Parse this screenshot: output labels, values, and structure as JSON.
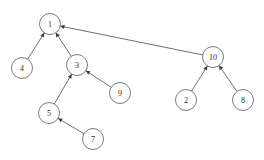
{
  "diagram": {
    "type": "directed-graph",
    "canvas": {
      "width": 264,
      "height": 160,
      "background": "#ffffff"
    },
    "style": {
      "node_radius": 10.5,
      "node_fill": "#ffffff",
      "node_stroke": "#5a5a5a",
      "edge_stroke": "#4a4a4a",
      "label_color": "#2b2b2b",
      "arrow_fill": "#3a3a3a"
    },
    "nodes": [
      {
        "id": "n1",
        "label": "1",
        "x": 50,
        "y": 24
      },
      {
        "id": "n4",
        "label": "4",
        "x": 22,
        "y": 68
      },
      {
        "id": "n3",
        "label": "3",
        "x": 77,
        "y": 65
      },
      {
        "id": "n9",
        "label": "9",
        "x": 120,
        "y": 93
      },
      {
        "id": "n5",
        "label": "5",
        "x": 49,
        "y": 113
      },
      {
        "id": "n7",
        "label": "7",
        "x": 93,
        "y": 139
      },
      {
        "id": "n10",
        "label": "10",
        "x": 213,
        "y": 57
      },
      {
        "id": "n2",
        "label": "2",
        "x": 186,
        "y": 100
      },
      {
        "id": "n8",
        "label": "8",
        "x": 243,
        "y": 100
      }
    ],
    "edges": [
      {
        "from": "n4",
        "to": "n1",
        "directed": true
      },
      {
        "from": "n3",
        "to": "n1",
        "directed": true
      },
      {
        "from": "n10",
        "to": "n1",
        "directed": true
      },
      {
        "from": "n5",
        "to": "n3",
        "directed": true
      },
      {
        "from": "n9",
        "to": "n3",
        "directed": true
      },
      {
        "from": "n7",
        "to": "n5",
        "directed": true
      },
      {
        "from": "n2",
        "to": "n10",
        "directed": true
      },
      {
        "from": "n8",
        "to": "n10",
        "directed": true
      }
    ]
  }
}
